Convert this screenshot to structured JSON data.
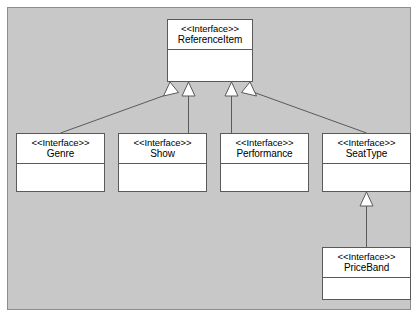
{
  "diagram": {
    "type": "uml-class-diagram",
    "stereotype_label": "<<Interface>>",
    "relationship": "generalization",
    "canvas_color": "#c8c8c8",
    "class_fill_color": "#ffffff",
    "line_color": "#5a5a5a",
    "classes": [
      {
        "id": "reference-item",
        "stereotype": "<<Interface>>",
        "name": "ReferenceItem",
        "x": 167,
        "y": 19,
        "w": 86,
        "h": 63,
        "header_h": 30
      },
      {
        "id": "genre",
        "stereotype": "<<Interface>>",
        "name": "Genre",
        "x": 16,
        "y": 133,
        "w": 89,
        "h": 59,
        "header_h": 30
      },
      {
        "id": "show",
        "stereotype": "<<Interface>>",
        "name": "Show",
        "x": 118,
        "y": 133,
        "w": 89,
        "h": 59,
        "header_h": 30
      },
      {
        "id": "performance",
        "stereotype": "<<Interface>>",
        "name": "Performance",
        "x": 220,
        "y": 133,
        "w": 89,
        "h": 59,
        "header_h": 30
      },
      {
        "id": "seat-type",
        "stereotype": "<<Interface>>",
        "name": "SeatType",
        "x": 322,
        "y": 133,
        "w": 89,
        "h": 59,
        "header_h": 30
      },
      {
        "id": "price-band",
        "stereotype": "<<Interface>>",
        "name": "PriceBand",
        "x": 322,
        "y": 247,
        "w": 89,
        "h": 53,
        "header_h": 30
      }
    ],
    "generalizations": [
      {
        "from": "genre",
        "to": "reference-item"
      },
      {
        "from": "show",
        "to": "reference-item"
      },
      {
        "from": "performance",
        "to": "reference-item"
      },
      {
        "from": "seat-type",
        "to": "reference-item"
      },
      {
        "from": "price-band",
        "to": "seat-type"
      }
    ]
  }
}
